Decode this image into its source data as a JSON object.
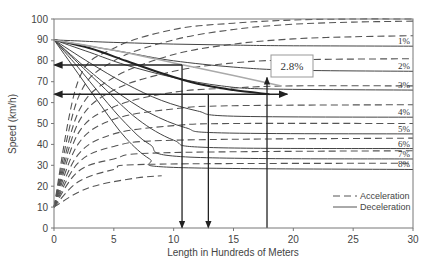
{
  "chart_data": {
    "type": "line",
    "title": "",
    "xlabel": "Length in Hundreds of Meters",
    "ylabel": "Speed (km/h)",
    "xlim": [
      0,
      30
    ],
    "ylim": [
      0,
      100
    ],
    "x_ticks": [
      0,
      5,
      10,
      15,
      20,
      25,
      30
    ],
    "y_ticks": [
      0,
      10,
      20,
      30,
      40,
      50,
      60,
      70,
      80,
      90,
      100
    ],
    "grid": false,
    "legend_position": "lower right",
    "legend": [
      {
        "label": "Acceleration",
        "style": "dashed"
      },
      {
        "label": "Deceleration",
        "style": "solid"
      }
    ],
    "deceleration_series": [
      {
        "name": "1%",
        "start_speed": 90,
        "crawl_speed": 87,
        "x": [
          0,
          2,
          5,
          10,
          15,
          20,
          30
        ],
        "values": [
          90,
          89.5,
          88.8,
          88,
          87.5,
          87.2,
          87
        ]
      },
      {
        "name": "2%",
        "start_speed": 90,
        "crawl_speed": 75,
        "x": [
          0,
          3,
          6,
          10,
          15,
          20,
          30
        ],
        "values": [
          90,
          87,
          84,
          80,
          77,
          75.5,
          75
        ]
      },
      {
        "name": "3%",
        "start_speed": 90,
        "crawl_speed": 66,
        "x": [
          0,
          3,
          6,
          10,
          14,
          18,
          30
        ],
        "values": [
          90,
          84,
          78,
          72,
          68,
          66.5,
          66
        ]
      },
      {
        "name": "4%",
        "start_speed": 90,
        "crawl_speed": 53,
        "x": [
          0,
          3,
          6,
          9,
          12,
          15,
          30
        ],
        "values": [
          90,
          79,
          69,
          61,
          56,
          53.5,
          53
        ]
      },
      {
        "name": "5%",
        "start_speed": 90,
        "crawl_speed": 45,
        "x": [
          0,
          3,
          5,
          8,
          11,
          14,
          30
        ],
        "values": [
          90,
          75,
          66,
          55,
          48,
          45.5,
          45
        ]
      },
      {
        "name": "6%",
        "start_speed": 90,
        "crawl_speed": 38,
        "x": [
          0,
          2,
          4,
          7,
          10,
          13,
          30
        ],
        "values": [
          90,
          79,
          68,
          52,
          42,
          38.5,
          38
        ]
      },
      {
        "name": "7%",
        "start_speed": 90,
        "crawl_speed": 33,
        "x": [
          0,
          2,
          4,
          6,
          8,
          11,
          30
        ],
        "values": [
          90,
          77,
          63,
          50,
          40,
          34,
          33
        ]
      },
      {
        "name": "8%",
        "start_speed": 90,
        "crawl_speed": 28,
        "x": [
          0,
          2,
          4,
          6,
          8,
          10,
          30
        ],
        "values": [
          90,
          74,
          58,
          43,
          33,
          29,
          28
        ]
      }
    ],
    "acceleration_series": [
      {
        "name": "-A",
        "start_speed": 10,
        "crawl_speed": 100,
        "x": [
          0,
          2,
          5,
          10,
          15,
          20,
          25,
          30
        ],
        "values": [
          10,
          70,
          86,
          95,
          98,
          99.5,
          100,
          100
        ]
      },
      {
        "name": "0%",
        "start_speed": 10,
        "crawl_speed": 99,
        "x": [
          0,
          2,
          5,
          10,
          15,
          20,
          25,
          30
        ],
        "values": [
          10,
          62,
          80,
          90,
          95,
          97.5,
          98.5,
          99
        ]
      },
      {
        "name": "1%",
        "start_speed": 10,
        "crawl_speed": 92,
        "x": [
          0,
          2,
          5,
          10,
          15,
          20,
          25,
          30
        ],
        "values": [
          10,
          55,
          72,
          83,
          88,
          90.5,
          91.5,
          92
        ]
      },
      {
        "name": "2%",
        "start_speed": 10,
        "crawl_speed": 81,
        "x": [
          0,
          2,
          5,
          10,
          15,
          20,
          30
        ],
        "values": [
          10,
          50,
          66,
          75,
          79,
          80.5,
          81
        ]
      },
      {
        "name": "3%",
        "start_speed": 10,
        "crawl_speed": 68,
        "x": [
          0,
          2,
          5,
          10,
          15,
          20,
          30
        ],
        "values": [
          10,
          45,
          58,
          65,
          67,
          68,
          68
        ]
      },
      {
        "name": "4%",
        "start_speed": 10,
        "crawl_speed": 59,
        "x": [
          0,
          2,
          5,
          10,
          15,
          30
        ],
        "values": [
          10,
          40,
          52,
          57,
          58.5,
          59
        ]
      },
      {
        "name": "5%",
        "start_speed": 10,
        "crawl_speed": 50,
        "x": [
          0,
          2,
          5,
          10,
          15,
          30
        ],
        "values": [
          10,
          35,
          45,
          49,
          50,
          50
        ]
      },
      {
        "name": "6%",
        "start_speed": 10,
        "crawl_speed": 43,
        "x": [
          0,
          2,
          5,
          10,
          30
        ],
        "values": [
          10,
          31,
          39,
          42,
          43
        ]
      },
      {
        "name": "7%",
        "start_speed": 10,
        "crawl_speed": 37,
        "x": [
          0,
          2,
          5,
          9,
          30
        ],
        "values": [
          10,
          27,
          33,
          36,
          37
        ]
      },
      {
        "name": "8%",
        "start_speed": 10,
        "crawl_speed": 31,
        "x": [
          0,
          2,
          5,
          8,
          30
        ],
        "values": [
          10,
          22,
          28,
          30.5,
          31
        ]
      },
      {
        "name": "9%",
        "start_speed": 10,
        "crawl_speed": 25,
        "x": [
          0,
          2,
          4,
          7,
          9
        ],
        "values": [
          10,
          17,
          21,
          24,
          25
        ]
      }
    ],
    "example_deceleration_curve": {
      "name": "2.8% example",
      "x": [
        0,
        3,
        6,
        9,
        12,
        15,
        18
      ],
      "values": [
        90,
        86,
        80,
        74,
        69,
        66,
        64
      ]
    },
    "annotations": [
      {
        "type": "label_box",
        "text": "2.8%",
        "x": 18.5,
        "y": 77
      },
      {
        "type": "arrow_horizontal",
        "y": 78,
        "from_x": 10.7,
        "to_x": 0
      },
      {
        "type": "arrow_horizontal",
        "y": 64,
        "from_x": 0,
        "to_x": 19.5,
        "double_headed": true
      },
      {
        "type": "arrow_vertical_down",
        "x": 10.7,
        "from_y": 78,
        "to_y": 0
      },
      {
        "type": "arrow_vertical_down",
        "x": 12.9,
        "from_y": 64,
        "to_y": 0
      },
      {
        "type": "arrow_vertical_up",
        "x": 17.8,
        "from_y": 0,
        "to_y": 72
      }
    ]
  },
  "axes": {
    "xlabel": "Length in Hundreds of Meters",
    "ylabel": "Speed (km/h)"
  },
  "legend": {
    "acceleration": "Acceleration",
    "deceleration": "Deceleration"
  },
  "annotation_box": {
    "text": "2.8%"
  }
}
